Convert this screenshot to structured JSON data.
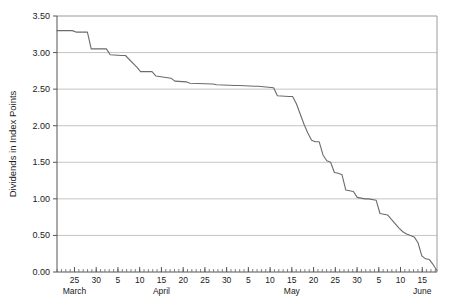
{
  "chart_data": {
    "type": "line",
    "title": "",
    "xlabel": "",
    "ylabel": "Dividends in Index Points",
    "ylim": [
      0.0,
      3.5
    ],
    "ytick_labels": [
      "0.00",
      "0.50",
      "1.00",
      "1.50",
      "2.00",
      "2.50",
      "3.00",
      "3.50"
    ],
    "ytick_values": [
      0.0,
      0.5,
      1.0,
      1.5,
      2.0,
      2.5,
      3.0,
      3.5
    ],
    "grid": true,
    "legend": null,
    "x_day_labels": [
      "25",
      "30",
      "5",
      "10",
      "15",
      "20",
      "25",
      "30",
      "5",
      "10",
      "15",
      "20",
      "25",
      "30",
      "5",
      "10",
      "15"
    ],
    "x_month_labels": [
      "March",
      "April",
      "May",
      "June"
    ],
    "x_axis_units": "calendar days",
    "series": [
      {
        "name": "Dividends",
        "x": [
          0,
          4,
          5,
          8,
          9,
          13,
          14,
          17,
          18,
          21,
          22,
          25,
          26,
          30,
          31,
          34,
          35,
          41,
          42,
          47,
          48,
          52,
          53,
          57,
          58,
          61,
          62,
          63,
          64,
          65,
          66,
          67,
          68,
          69,
          70,
          71,
          72,
          73,
          74,
          75,
          76,
          78,
          79,
          81,
          82,
          84,
          85,
          87,
          88,
          90,
          91,
          92,
          93,
          94,
          95,
          96,
          97,
          98,
          99,
          100
        ],
        "y": [
          3.3,
          3.3,
          3.28,
          3.28,
          3.05,
          3.05,
          2.97,
          2.96,
          2.96,
          2.8,
          2.74,
          2.74,
          2.68,
          2.65,
          2.61,
          2.6,
          2.58,
          2.57,
          2.56,
          2.55,
          2.55,
          2.54,
          2.54,
          2.52,
          2.41,
          2.4,
          2.4,
          2.3,
          2.16,
          2.02,
          1.9,
          1.8,
          1.78,
          1.78,
          1.6,
          1.52,
          1.5,
          1.36,
          1.35,
          1.33,
          1.12,
          1.1,
          1.02,
          1.0,
          1.0,
          0.98,
          0.8,
          0.78,
          0.72,
          0.6,
          0.55,
          0.52,
          0.5,
          0.48,
          0.4,
          0.22,
          0.18,
          0.17,
          0.1,
          0.02
        ]
      }
    ]
  },
  "axes": {
    "y_axis_title": "Dividends in Index Points"
  }
}
